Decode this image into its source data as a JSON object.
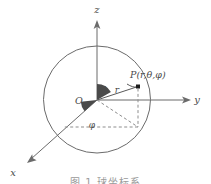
{
  "figure": {
    "kind": "spherical-coordinate-diagram",
    "caption": "图 1 球坐标系",
    "background_color": "#ffffff",
    "ink_color": "#6b6b6b",
    "wedge_color": "#4a4a4a",
    "dash_color": "#8d8d8d"
  },
  "axes": [
    {
      "id": "z",
      "label": "z",
      "direction": "up",
      "label_x": 97,
      "label_y": 13
    },
    {
      "id": "y",
      "label": "y",
      "direction": "right",
      "label_x": 197,
      "label_y": 103
    },
    {
      "id": "x",
      "label": "x",
      "direction": "down-left",
      "label_x": 13,
      "label_y": 176
    }
  ],
  "origin": {
    "label": "O",
    "x": 97,
    "y": 100,
    "label_x": 79,
    "label_y": 104
  },
  "sphere": {
    "center_x": 97,
    "center_y": 99.5,
    "radius": 53.5
  },
  "point": {
    "label": "P(r,θ,φ)",
    "x": 138,
    "y": 86,
    "label_x": 130,
    "label_y": 78
  },
  "angles": [
    {
      "id": "theta",
      "label": "θ",
      "label_x": 104,
      "label_y": 93
    },
    {
      "id": "phi",
      "label": "φ",
      "label_x": 92,
      "label_y": 128
    }
  ],
  "radius": {
    "label": "r",
    "label_x": 117,
    "label_y": 93
  }
}
